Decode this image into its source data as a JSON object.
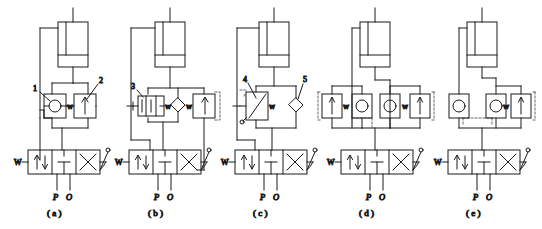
{
  "figure": {
    "panel_count": 5,
    "line_color": "#1a1a1a",
    "dashed_color": "#555555",
    "background": "#ffffff"
  },
  "panels": [
    {
      "id": "a",
      "caption": "( a )",
      "port_p": "P",
      "port_o": "O",
      "dcv_label": "W",
      "callouts": [
        {
          "id": "1",
          "text": "1",
          "target": "check-valve"
        },
        {
          "id": "2",
          "text": "2",
          "target": "throttle-valve"
        }
      ],
      "valves": [
        {
          "name": "check-valve",
          "symbol": "circle-in-square"
        },
        {
          "name": "throttle-valve",
          "symbol": "arrow-in-square",
          "mark": "W"
        }
      ]
    },
    {
      "id": "b",
      "caption": "( b )",
      "port_p": "P",
      "port_o": "O",
      "dcv_label": "W",
      "callouts": [
        {
          "id": "3",
          "text": "3",
          "target": "pressure-relief-valve"
        }
      ],
      "valves": [
        {
          "name": "pressure-relief-valve",
          "symbol": "spool-box",
          "mark": "W"
        },
        {
          "name": "check-valve",
          "symbol": "diamond"
        },
        {
          "name": "throttle-valve",
          "symbol": "arrow-in-square"
        }
      ]
    },
    {
      "id": "c",
      "caption": "( c )",
      "port_p": "P",
      "port_o": "O",
      "dcv_label": "W",
      "callouts": [
        {
          "id": "4",
          "text": "4",
          "target": "throttle-valve"
        },
        {
          "id": "5",
          "text": "5",
          "target": "check-valve"
        }
      ],
      "valves": [
        {
          "name": "throttle-valve",
          "symbol": "slanted-arrow-box",
          "mark": "W"
        },
        {
          "name": "check-valve",
          "symbol": "diamond"
        }
      ]
    },
    {
      "id": "d",
      "caption": "( d )",
      "port_p": "P",
      "port_o": "O",
      "dcv_label": "W",
      "callouts": [],
      "valves": [
        {
          "name": "throttle-valve-left",
          "symbol": "arrow-in-square",
          "mark": "W"
        },
        {
          "name": "check-valve-left",
          "symbol": "circle-in-square"
        },
        {
          "name": "check-valve-right",
          "symbol": "circle-in-square"
        },
        {
          "name": "throttle-valve-right",
          "symbol": "arrow-in-square",
          "mark": "W"
        }
      ]
    },
    {
      "id": "e",
      "caption": "( e )",
      "port_p": "P",
      "port_o": "O",
      "dcv_label": "W",
      "callouts": [],
      "valves": [
        {
          "name": "check-valve-left",
          "symbol": "circle-in-square"
        },
        {
          "name": "check-valve-right",
          "symbol": "circle-in-square"
        },
        {
          "name": "throttle-valve",
          "symbol": "arrow-in-square",
          "mark": "W"
        }
      ]
    }
  ]
}
